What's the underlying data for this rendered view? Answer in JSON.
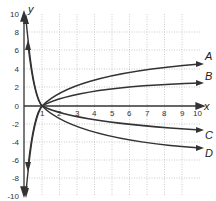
{
  "graph": {
    "x_axis_label": "x",
    "y_axis_label": "y",
    "x_ticks": [
      "1",
      "2",
      "3",
      "4",
      "5",
      "6",
      "7",
      "8",
      "9",
      "10"
    ],
    "y_ticks": [
      "10",
      "8",
      "6",
      "4",
      "2",
      "0",
      "-2",
      "-4",
      "-6",
      "-8",
      "-10"
    ],
    "curves": [
      {
        "label": "A",
        "description": "increasing log curve, steepest positive"
      },
      {
        "label": "B",
        "description": "increasing log curve, gentler"
      },
      {
        "label": "C",
        "description": "decreasing log curve, gentler"
      },
      {
        "label": "D",
        "description": "decreasing log curve, steepest negative"
      }
    ],
    "colors": {
      "curve": "#333333",
      "grid": "#999999",
      "axis": "#333333"
    }
  }
}
